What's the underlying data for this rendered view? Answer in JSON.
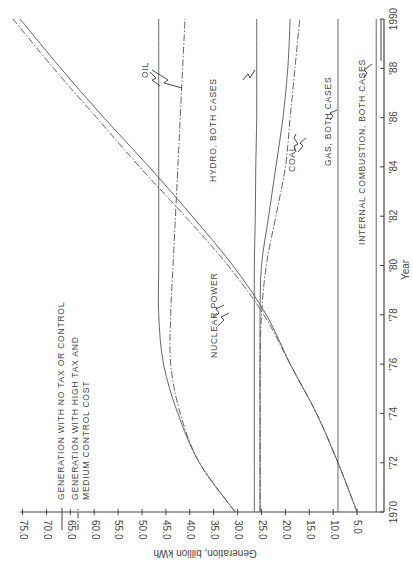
{
  "chart_data": {
    "type": "line",
    "orientation_note": "rotated 90 degrees counter-clockwise on page",
    "title": "",
    "xlabel": "Year",
    "ylabel": "Generation, billion kWh",
    "xlim": [
      1970,
      1990
    ],
    "ylim": [
      0,
      75
    ],
    "x_tick_labels": [
      "1970",
      "'72",
      "'74",
      "'76",
      "'78",
      "'80",
      "'82",
      "'84",
      "'86",
      "'88",
      "1990"
    ],
    "y_tick_labels": [
      "5.0",
      "10.0",
      "15.0",
      "20.0",
      "25.0",
      "30.0",
      "35.0",
      "40.0",
      "45.0",
      "50.0",
      "55.0",
      "60.0",
      "65.0",
      "70.0",
      "75.0"
    ],
    "grid": false,
    "legend": [
      {
        "style": "solid",
        "label": "GENERATION WITH NO TAX OR CONTROL"
      },
      {
        "style": "dash-dot",
        "label": "GENERATION WITH HIGH TAX AND MEDIUM CONTROL COST"
      }
    ],
    "x": [
      1970,
      1972,
      1974,
      1976,
      1978,
      1980,
      1982,
      1984,
      1986,
      1988,
      1990
    ],
    "series": [
      {
        "name": "Oil - no tax",
        "style": "solid",
        "values": [
          30.5,
          38.0,
          42.5,
          45.5,
          46.5,
          46.5,
          46.5,
          46.5,
          46.5,
          46.5,
          46.5
        ]
      },
      {
        "name": "Oil - high tax",
        "style": "dash-dot",
        "values": [
          30.5,
          38.0,
          42.0,
          44.0,
          44.0,
          43.5,
          43.0,
          42.5,
          42.0,
          41.5,
          41.0
        ]
      },
      {
        "name": "Nuclear power - no tax",
        "style": "solid",
        "values": [
          5.0,
          9.0,
          13.5,
          19.0,
          24.0,
          31.0,
          39.5,
          48.5,
          58.0,
          67.0,
          75.5
        ]
      },
      {
        "name": "Nuclear power - high tax",
        "style": "dash-dot",
        "values": [
          5.0,
          9.0,
          13.5,
          19.0,
          24.5,
          32.0,
          41.0,
          50.5,
          59.5,
          68.5,
          77.0
        ]
      },
      {
        "name": "Hydro, both cases",
        "style": "solid",
        "values": [
          26.5,
          26.5,
          26.5,
          26.5,
          26.5,
          26.5,
          26.3,
          26.2,
          26.0,
          26.0,
          26.0
        ]
      },
      {
        "name": "Coal - no tax",
        "style": "solid",
        "values": [
          25.3,
          25.3,
          25.3,
          25.3,
          25.3,
          25.0,
          23.5,
          22.0,
          20.5,
          19.5,
          19.0
        ]
      },
      {
        "name": "Coal - high tax",
        "style": "dash-dot",
        "values": [
          25.3,
          25.3,
          25.3,
          25.3,
          25.0,
          24.0,
          22.0,
          20.0,
          19.0,
          18.0,
          17.0
        ]
      },
      {
        "name": "Gas, both cases",
        "style": "solid",
        "values": [
          9.0,
          9.0,
          9.0,
          9.0,
          9.0,
          9.0,
          9.0,
          9.0,
          9.0,
          9.0,
          9.0
        ]
      },
      {
        "name": "Internal combustion, both cases",
        "style": "solid",
        "values": [
          1.0,
          1.0,
          1.0,
          1.0,
          1.0,
          1.0,
          1.0,
          1.0,
          1.0,
          1.0,
          1.0
        ]
      }
    ],
    "annotations": [
      "OIL",
      "HYDRO, BOTH CASES",
      "COAL",
      "GAS, BOTH CASES",
      "INTERNAL COMBUSTION, BOTH CASES",
      "NUCLEAR POWER"
    ]
  },
  "labels": {
    "xlabel": "Year",
    "ylabel": "Generation, billion kWh",
    "legend_solid": "GENERATION WITH NO TAX OR CONTROL",
    "legend_dash_1": "GENERATION WITH HIGH TAX AND",
    "legend_dash_2": "MEDIUM CONTROL COST",
    "oil": "OIL",
    "hydro": "HYDRO, BOTH CASES",
    "coal": "COAL",
    "gas": "GAS, BOTH CASES",
    "ic": "INTERNAL COMBUSTION, BOTH CASES",
    "nuclear": "NUCLEAR POWER"
  }
}
